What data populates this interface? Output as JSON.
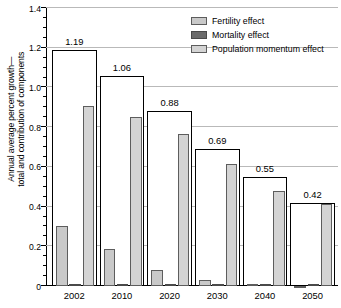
{
  "chart_data": {
    "type": "bar",
    "title": "",
    "subtitle": "",
    "xlabel": "",
    "ylabel": "Annual average percent growth—total and contribution of components",
    "ylabel_lines": [
      "Annual average percent growth—",
      "total and contribution of components"
    ],
    "categories": [
      "2002",
      "2010",
      "2020",
      "2030",
      "2040",
      "2050"
    ],
    "ylim": [
      0,
      1.4
    ],
    "yticks": [
      0,
      0.2,
      0.4,
      0.6,
      0.8,
      1.0,
      1.2,
      1.4
    ],
    "ytick_labels": [
      "0",
      "0.2",
      "0.4",
      "0.6",
      "0.8",
      "1.0",
      "1.2",
      "1.4"
    ],
    "y_minor_step": 0.05,
    "grid": true,
    "grid_axis": "y",
    "legend_position": "top-right",
    "legend": [
      "Fertility effect",
      "Mortality effect",
      "Population momentum effect"
    ],
    "series": [
      {
        "name": "Total",
        "type": "outline",
        "values": [
          1.19,
          1.06,
          0.88,
          0.69,
          0.55,
          0.42
        ],
        "labels": [
          "1.19",
          "1.06",
          "0.88",
          "0.69",
          "0.55",
          "0.42"
        ],
        "color": "#ffffff",
        "edge": "#000000"
      },
      {
        "name": "Fertility effect",
        "values": [
          0.3,
          0.185,
          0.08,
          0.03,
          0.01,
          -0.012
        ],
        "color": "#c9c9c9",
        "edge": "#5d5d5d"
      },
      {
        "name": "Mortality effect",
        "values": [
          0.008,
          0.007,
          0.006,
          0.005,
          0.005,
          0.005
        ],
        "color": "#6b6b6b",
        "edge": "#4a4a4a"
      },
      {
        "name": "Population momentum effect",
        "values": [
          0.905,
          0.85,
          0.765,
          0.615,
          0.48,
          0.415
        ],
        "color": "#d4d4d4",
        "edge": "#5d5d5d"
      }
    ]
  }
}
